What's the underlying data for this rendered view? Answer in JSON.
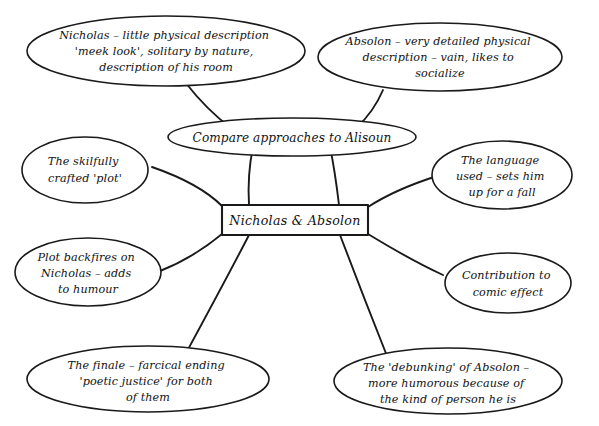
{
  "diagram": {
    "type": "mind-map",
    "title": "Nicholas & Absolon",
    "background_color": "#ffffff",
    "ink_color": "#1a1a1a",
    "style": "hand-drawn"
  },
  "central_node": {
    "label": "Nicholas & Absolon",
    "shape": "rectangle"
  },
  "hub_node": {
    "label": "Compare approaches to Alisoun",
    "shape": "ellipse"
  },
  "nodes": [
    {
      "id": "nicholas-description",
      "shape": "ellipse",
      "lines": [
        "Nicholas – little physical description",
        "'meek look', solitary by nature,",
        "description of his room"
      ]
    },
    {
      "id": "absolon-description",
      "shape": "ellipse",
      "lines": [
        "Absolon – very detailed physical",
        "description – vain, likes to",
        "socialize"
      ]
    },
    {
      "id": "skilfully-crafted-plot",
      "shape": "ellipse",
      "lines": [
        "The skilfully",
        "crafted 'plot'"
      ]
    },
    {
      "id": "language-used",
      "shape": "ellipse",
      "lines": [
        "The language",
        "used – sets him",
        "up for a fall"
      ]
    },
    {
      "id": "plot-backfires",
      "shape": "ellipse",
      "lines": [
        "Plot backfires on",
        "Nicholas – adds",
        "to humour"
      ]
    },
    {
      "id": "comic-effect",
      "shape": "ellipse",
      "lines": [
        "Contribution to",
        "comic effect"
      ]
    },
    {
      "id": "the-finale",
      "shape": "ellipse",
      "lines": [
        "The finale – farcical ending",
        "'poetic justice' for both",
        "of them"
      ]
    },
    {
      "id": "debunking-absolon",
      "shape": "ellipse",
      "lines": [
        "The 'debunking' of Absolon –",
        "more humorous because of",
        "the kind of person he is"
      ]
    }
  ]
}
